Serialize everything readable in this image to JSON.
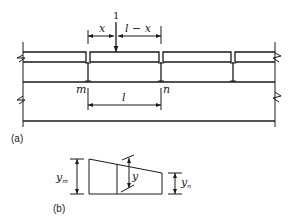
{
  "figure": {
    "part_a": {
      "caption": "(a)",
      "load_label": "1",
      "dim_left_label": "x",
      "dim_right_label": "l − x",
      "support_left_label": "m",
      "support_right_label": "n",
      "span_label": "l"
    },
    "part_b": {
      "caption": "(b)",
      "ordinate_left_label": "y",
      "ordinate_left_sub": "m",
      "ordinate_mid_label": "y",
      "ordinate_right_label": "y",
      "ordinate_right_sub": "n"
    },
    "colors": {
      "line": "#1a1a1a",
      "background": "#ffffff"
    }
  }
}
